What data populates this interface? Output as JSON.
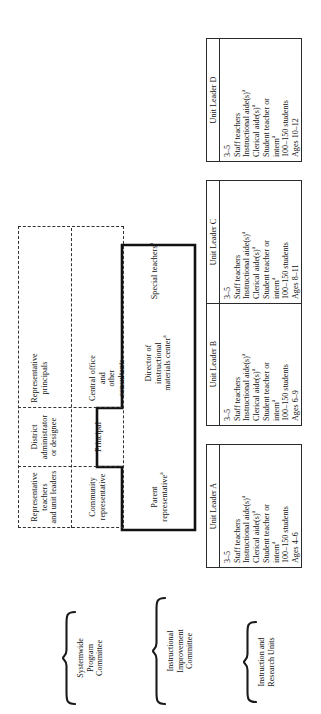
{
  "figure": {
    "orientation": "rotated-90",
    "background": "#ffffff",
    "ink": "#111111"
  },
  "row_captions": [
    {
      "id": "systemwide",
      "label": "Systemwide\nProgram\nCommittee"
    },
    {
      "id": "instructional-improvement",
      "label": "Instructional\nImprovement\nCommittee"
    },
    {
      "id": "instruction-research",
      "label": "Instruction and\nResearch Units"
    }
  ],
  "systemwide_committee": {
    "members_top": [
      {
        "id": "rep-teachers",
        "label": "Representative teachers\nand unit leaders"
      },
      {
        "id": "district-admin",
        "label": "District administrator\nor designee"
      },
      {
        "id": "rep-principals",
        "label": "Representative\nprincipals"
      }
    ],
    "members_bottom": [
      {
        "id": "community-rep",
        "label": "Community\nrepresentative"
      },
      {
        "id": "principal",
        "label": "Principal"
      },
      {
        "id": "central-office",
        "label": "Central office and\nother consultants"
      }
    ]
  },
  "improvement_committee": {
    "members": [
      {
        "id": "parent-rep",
        "label": "Parent representative",
        "note": "a"
      },
      {
        "id": "principal-shared",
        "label": "Principal",
        "note": ""
      },
      {
        "id": "director-imc",
        "label": "Director of instructional\nmaterials center",
        "note": "a"
      },
      {
        "id": "special-teachers",
        "label": "Special teachers",
        "note": "a"
      }
    ]
  },
  "units": [
    {
      "id": "unit-a",
      "title": "Unit Leader A",
      "lines": [
        "3–5",
        "Staff teachers",
        "Instructional aide(s)",
        "Clerical aide(s)",
        "Student teacher or",
        "intern",
        "100–150 students",
        "Ages 4–6"
      ],
      "notes": [
        "",
        "",
        "a",
        "a",
        "",
        "a",
        "",
        ""
      ]
    },
    {
      "id": "unit-b",
      "title": "Unit Leader B",
      "lines": [
        "3–5",
        "Staff teachers",
        "Instructional aide(s)",
        "Clerical aide(s)",
        "Student teacher or",
        "intern",
        "100–150 students",
        "Ages 6–9"
      ],
      "notes": [
        "",
        "",
        "a",
        "a",
        "",
        "a",
        "",
        ""
      ]
    },
    {
      "id": "unit-c",
      "title": "Unit Leader C",
      "lines": [
        "3–5",
        "Staff teachers",
        "Instructional aide(s)",
        "Clerical aide(s)",
        "Student teacher or",
        "intern",
        "100–150 students",
        "Ages 8–11"
      ],
      "notes": [
        "",
        "",
        "a",
        "a",
        "",
        "a",
        "",
        ""
      ]
    },
    {
      "id": "unit-d",
      "title": "Unit Leader D",
      "lines": [
        "3–5",
        "Staff teachers",
        "Instructional aide(s)",
        "Clerical aide(s)",
        "Student teacher or",
        "intern",
        "100–150 students",
        "Ages 10–12"
      ],
      "notes": [
        "",
        "",
        "a",
        "a",
        "",
        "a",
        "",
        ""
      ]
    }
  ]
}
